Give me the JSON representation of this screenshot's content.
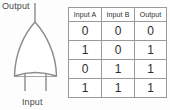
{
  "diagram": {
    "gate_type": "OR gate",
    "orientation": "vertical (output at top)",
    "output_label": "Output",
    "input_label": "Input",
    "line_color": "#8a8a8a",
    "text_color": "#4a4a4a"
  },
  "table": {
    "headers": [
      "Input A",
      "Input B",
      "Output"
    ],
    "rows": [
      [
        "0",
        "0",
        "0"
      ],
      [
        "1",
        "0",
        "1"
      ],
      [
        "0",
        "1",
        "1"
      ],
      [
        "1",
        "1",
        "1"
      ]
    ],
    "border_color": "#9a9a9a"
  }
}
